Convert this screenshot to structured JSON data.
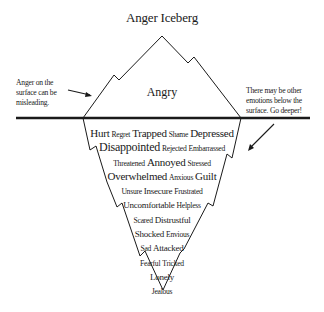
{
  "title": "Anger Iceberg",
  "surface_emotion": "Angry",
  "notes": {
    "left": [
      "Anger on the",
      "surface can be",
      "misleading."
    ],
    "right": [
      "There may be other",
      "emotions below the",
      "surface. Go deeper!"
    ]
  },
  "colors": {
    "line": "#1a1a1a",
    "background": "#ffffff"
  },
  "underwater_rows": [
    [
      {
        "w": "Hurt",
        "s": "lg"
      },
      {
        "w": "Regret",
        "s": "sm"
      },
      {
        "w": "Trapped",
        "s": "lg"
      },
      {
        "w": "Shame",
        "s": "sm"
      },
      {
        "w": "Depressed",
        "s": "lg"
      }
    ],
    [
      {
        "w": "Disappointed",
        "s": "xl"
      },
      {
        "w": "Rejected",
        "s": "sm"
      },
      {
        "w": "Embarrassed",
        "s": "sm"
      }
    ],
    [
      {
        "w": "Threatened",
        "s": "sm"
      },
      {
        "w": "Annoyed",
        "s": "lg"
      },
      {
        "w": "Stressed",
        "s": "sm"
      }
    ],
    [
      {
        "w": "Overwhelmed",
        "s": "lg"
      },
      {
        "w": "Anxious",
        "s": "sm"
      },
      {
        "w": "Guilt",
        "s": "lg"
      }
    ],
    [
      {
        "w": "Unsure",
        "s": "sm"
      },
      {
        "w": "Insecure",
        "s": "md"
      },
      {
        "w": "Frustrated",
        "s": "sm"
      }
    ],
    [
      {
        "w": "Uncomfortable",
        "s": "md"
      },
      {
        "w": "Helpless",
        "s": "sm"
      }
    ],
    [
      {
        "w": "Scared",
        "s": "sm"
      },
      {
        "w": "Distrustful",
        "s": "md"
      }
    ],
    [
      {
        "w": "Shocked",
        "s": "md"
      },
      {
        "w": "Envious",
        "s": "sm"
      }
    ],
    [
      {
        "w": "Sad",
        "s": "sm"
      },
      {
        "w": "Attacked",
        "s": "md"
      }
    ],
    [
      {
        "w": "Fearful",
        "s": "sm"
      },
      {
        "w": "Tricked",
        "s": "sm"
      }
    ],
    [
      {
        "w": "Lonely",
        "s": "md"
      }
    ],
    [
      {
        "w": "Jealous",
        "s": "sm"
      }
    ]
  ]
}
